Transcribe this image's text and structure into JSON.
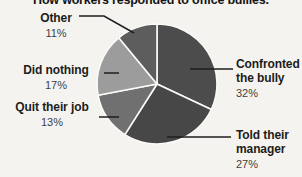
{
  "page": {
    "title": "How workers responded to office bullies."
  },
  "chart_data": {
    "type": "pie",
    "title": "How workers responded to office bullies.",
    "unit": "%",
    "direction": "clockwise",
    "start_angle_deg": 0,
    "categories": [
      "Confronted the bully",
      "Told their manager",
      "Quit their job",
      "Did nothing",
      "Other"
    ],
    "values": [
      32,
      27,
      13,
      17,
      11
    ],
    "slices": [
      {
        "label": "Confronted the bully",
        "pct": 32,
        "pct_text": "32%",
        "color": "#4c4c4c"
      },
      {
        "label": "Told their manager",
        "pct": 27,
        "pct_text": "27%",
        "color": "#474747"
      },
      {
        "label": "Quit their job",
        "pct": 13,
        "pct_text": "13%",
        "color": "#707070"
      },
      {
        "label": "Did nothing",
        "pct": 17,
        "pct_text": "17%",
        "color": "#9c9c9c"
      },
      {
        "label": "Other",
        "pct": 11,
        "pct_text": "11%",
        "color": "#5d5d5d"
      }
    ],
    "separator_color": "#fbfaf7",
    "leader_line_color": "#1e1e1e",
    "legend_position": "none",
    "labels_layout": "outside with leader lines"
  }
}
